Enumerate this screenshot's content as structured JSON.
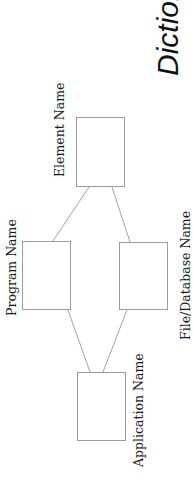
{
  "title": "Dictionary",
  "colors": {
    "background": "#ffffff",
    "box_border": "#9a9a9a",
    "line": "#8a8a8a",
    "text": "#1a1a1a"
  },
  "nodes": [
    {
      "id": "element",
      "label": "Element Name"
    },
    {
      "id": "program",
      "label": "Program Name"
    },
    {
      "id": "file",
      "label": "File/Database Name"
    },
    {
      "id": "application",
      "label": "Application Name"
    }
  ],
  "edges": [
    {
      "from": "element",
      "to": "program"
    },
    {
      "from": "element",
      "to": "file"
    },
    {
      "from": "program",
      "to": "application"
    },
    {
      "from": "file",
      "to": "application"
    }
  ]
}
